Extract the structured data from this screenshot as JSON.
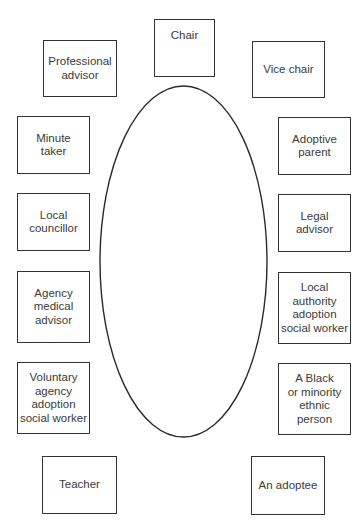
{
  "diagram": {
    "type": "seating-plan",
    "table": {
      "shape": "ellipse",
      "cx": 183.5,
      "cy": 261.5,
      "rx": 83.5,
      "ry": 175.5
    },
    "seats": [
      {
        "id": "chair",
        "label": "Chair",
        "x": 154,
        "y": 19,
        "w": 61,
        "h": 58,
        "align": "top"
      },
      {
        "id": "professional-advisor",
        "label": "Professional\nadvisor",
        "x": 43,
        "y": 40,
        "w": 74,
        "h": 57
      },
      {
        "id": "vice-chair",
        "label": "Vice chair",
        "x": 252,
        "y": 41,
        "w": 73,
        "h": 57
      },
      {
        "id": "minute-taker",
        "label": "Minute\ntaker",
        "x": 17,
        "y": 116,
        "w": 73,
        "h": 58
      },
      {
        "id": "adoptive-parent",
        "label": "Adoptive\nparent",
        "x": 278,
        "y": 117,
        "w": 73,
        "h": 58
      },
      {
        "id": "local-councillor",
        "label": "Local\ncouncillor",
        "x": 17,
        "y": 193,
        "w": 73,
        "h": 58
      },
      {
        "id": "legal-advisor",
        "label": "Legal\nadvisor",
        "x": 278,
        "y": 194,
        "w": 73,
        "h": 58
      },
      {
        "id": "agency-medical-advisor",
        "label": "Agency\nmedical\nadvisor",
        "x": 17,
        "y": 271,
        "w": 73,
        "h": 72
      },
      {
        "id": "local-authority-adoption-social-worker",
        "label": "Local\nauthority\nadoption\nsocial worker",
        "x": 278,
        "y": 272,
        "w": 73,
        "h": 72
      },
      {
        "id": "voluntary-agency-adoption-social-worker",
        "label": "Voluntary\nagency\nadoption\nsocial worker",
        "x": 17,
        "y": 362,
        "w": 73,
        "h": 72
      },
      {
        "id": "black-or-minority-ethnic-person",
        "label": "A Black\nor minority\nethnic\nperson",
        "x": 278,
        "y": 363,
        "w": 73,
        "h": 72
      },
      {
        "id": "teacher",
        "label": "Teacher",
        "x": 42,
        "y": 456,
        "w": 75,
        "h": 58
      },
      {
        "id": "adoptee",
        "label": "An adoptee",
        "x": 251,
        "y": 456,
        "w": 74,
        "h": 59
      }
    ]
  }
}
